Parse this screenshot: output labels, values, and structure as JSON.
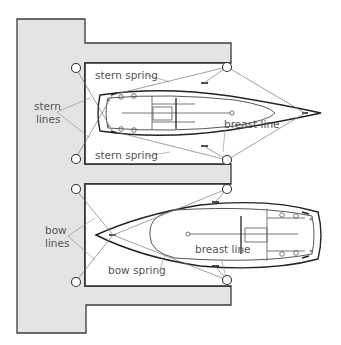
{
  "diagram": {
    "labels": {
      "stern_lines_1": "stern",
      "stern_lines_2": "lines",
      "stern_spring_top": "stern spring",
      "stern_spring_bottom": "stern spring",
      "breast_line_top": "breast line",
      "bow_lines_1": "bow",
      "bow_lines_2": "lines",
      "bow_spring": "bow spring",
      "breast_line_bottom": "breast line"
    },
    "colors": {
      "dock_fill": "#e4e4e4",
      "outline": "#2a2a2a",
      "line_color": "#777777",
      "label_color": "#555555"
    },
    "boats": [
      {
        "name": "upper-boat",
        "orientation": "stern-to-quay, bow pointing right"
      },
      {
        "name": "lower-boat",
        "orientation": "bow-to-quay, stern pointing right"
      }
    ]
  }
}
